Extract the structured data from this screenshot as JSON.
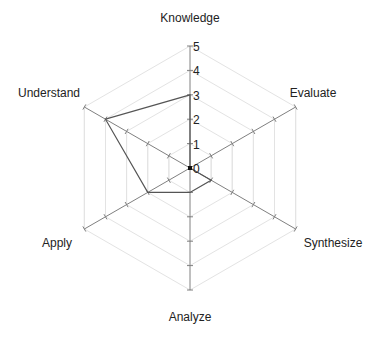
{
  "chart_data": {
    "type": "radar",
    "title": "",
    "axes": [
      "Knowledge",
      "Evaluate",
      "Synthesize",
      "Analyze",
      "Apply",
      "Understand"
    ],
    "series": [
      {
        "name": "",
        "values": [
          3,
          0,
          1,
          1,
          2,
          4
        ]
      }
    ],
    "rlim": [
      0,
      5
    ],
    "rticks": [
      0,
      1,
      2,
      3,
      4,
      5
    ],
    "grid": true,
    "legend": false
  },
  "colors": {
    "series": "#555555",
    "axis": "#808080",
    "grid": "#e3e3e3"
  },
  "layout": {
    "center_x": 190,
    "center_y": 168,
    "radius": 122
  }
}
